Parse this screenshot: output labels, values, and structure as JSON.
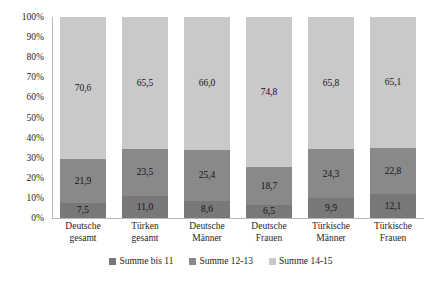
{
  "chart_data": {
    "type": "bar",
    "subtype": "stacked-bar-100-percent",
    "title": "",
    "xlabel": "",
    "ylabel": "",
    "ylim": [
      0,
      100
    ],
    "ytick_labels": [
      "100%",
      "90%",
      "80%",
      "70%",
      "60%",
      "50%",
      "40%",
      "30%",
      "20%",
      "10%",
      "0%"
    ],
    "ytick_values": [
      100,
      90,
      80,
      70,
      60,
      50,
      40,
      30,
      20,
      10,
      0
    ],
    "grid": false,
    "legend_position": "bottom",
    "decimal_separator": ",",
    "categories": [
      "Deutsche gesamt",
      "Türken gesamt",
      "Deutsche Männer",
      "Deutsche Frauen",
      "Türkische Männer",
      "Türkische Frauen"
    ],
    "category_lines": [
      [
        "Deutsche",
        "gesamt"
      ],
      [
        "Türken",
        "gesamt"
      ],
      [
        "Deutsche",
        "Männer"
      ],
      [
        "Deutsche",
        "Frauen"
      ],
      [
        "Türkische",
        "Männer"
      ],
      [
        "Türkische",
        "Frauen"
      ]
    ],
    "series": [
      {
        "name": "Summe bis 11",
        "color": "#787878",
        "values": [
          7.5,
          11.0,
          8.6,
          6.5,
          9.9,
          12.1
        ],
        "labels": [
          "7,5",
          "11,0",
          "8,6",
          "6,5",
          "9,9",
          "12,1"
        ]
      },
      {
        "name": "Summe 12-13",
        "color": "#898989",
        "values": [
          21.9,
          23.5,
          25.4,
          18.7,
          24.3,
          22.8
        ],
        "labels": [
          "21,9",
          "23,5",
          "25,4",
          "18,7",
          "24,3",
          "22,8"
        ]
      },
      {
        "name": "Summe 14-15",
        "color": "#c9c9c9",
        "values": [
          70.6,
          65.5,
          66.0,
          74.8,
          65.8,
          65.1
        ],
        "labels": [
          "70,6",
          "65,5",
          "66,0",
          "74,8",
          "65,8",
          "65,1"
        ]
      }
    ]
  },
  "legend": {
    "items": [
      {
        "label": "Summe bis 11",
        "color": "#787878"
      },
      {
        "label": "Summe 12-13",
        "color": "#898989"
      },
      {
        "label": "Summe 14-15",
        "color": "#c9c9c9"
      }
    ]
  }
}
